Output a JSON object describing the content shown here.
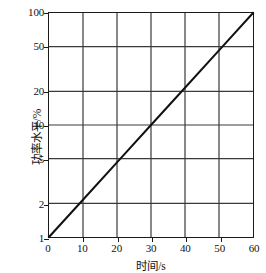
{
  "chart_data": {
    "type": "line",
    "title": "",
    "subtitle": "",
    "xlabel": "时间/s",
    "ylabel": "功率水平/%",
    "xscale": "linear",
    "yscale": "log",
    "xlim": [
      0,
      60
    ],
    "ylim": [
      1,
      100
    ],
    "grid": true,
    "legend": null,
    "legend_position": "none",
    "x_ticks": [
      0,
      10,
      20,
      30,
      40,
      50,
      60
    ],
    "x_tick_labels": [
      "0",
      "10",
      "20",
      "30",
      "40",
      "50",
      "60"
    ],
    "y_ticks": [
      1,
      2,
      5,
      10,
      20,
      50,
      100
    ],
    "y_tick_labels": [
      "1",
      "2",
      "5",
      "10",
      "20",
      "50",
      "100"
    ],
    "series": [
      {
        "name": "功率水平",
        "color": "#111111",
        "line_width": 2,
        "x": [
          0,
          10,
          20,
          30,
          40,
          50,
          60
        ],
        "values": [
          1,
          2.15,
          4.64,
          10,
          21.5,
          46.4,
          100
        ]
      }
    ],
    "annotations": []
  },
  "figure": {
    "background": "#ffffff",
    "frame_color": "#1a1a1a",
    "grid_color": "#3a3a3a",
    "text_color": "#111111"
  }
}
